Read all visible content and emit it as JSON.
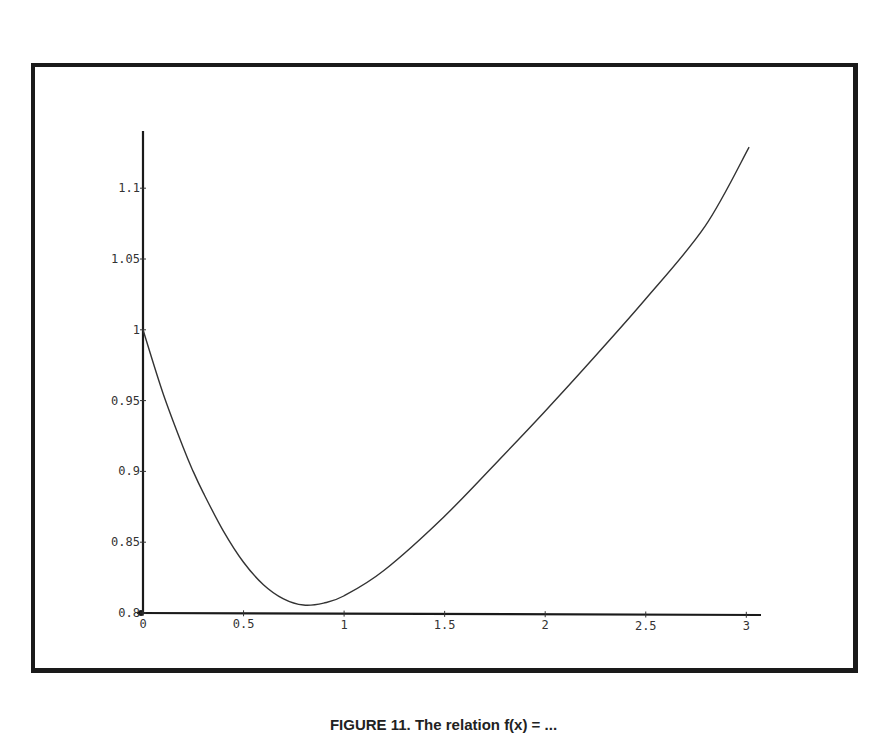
{
  "caption": "FIGURE 11. The relation f(x) = ...",
  "chart_data": {
    "type": "line",
    "title": "",
    "xlabel": "",
    "ylabel": "",
    "xlim": [
      0,
      3.08
    ],
    "ylim": [
      0.8,
      1.135
    ],
    "grid": false,
    "legend": null,
    "x_ticks": [
      0,
      0.5,
      1,
      1.5,
      2,
      2.5,
      3
    ],
    "x_tick_labels": [
      "0",
      "0.5",
      "1",
      "1.5",
      "2",
      "2.5",
      "3"
    ],
    "y_ticks": [
      0.8,
      0.85,
      0.9,
      0.95,
      1,
      1.05,
      1.1
    ],
    "y_tick_labels": [
      "0.8",
      "0.85",
      "0.9",
      "0.95",
      "1",
      "1.05",
      "1.1"
    ],
    "series": [
      {
        "name": "f(x)",
        "color": "#333333",
        "x": [
          0,
          0.1,
          0.2,
          0.25,
          0.3,
          0.4,
          0.5,
          0.6,
          0.7,
          0.8,
          0.9,
          1.0,
          1.2,
          1.5,
          1.8,
          2.0,
          2.2,
          2.5,
          2.8,
          3.02
        ],
        "y": [
          1.0,
          0.955,
          0.917,
          0.9,
          0.885,
          0.858,
          0.836,
          0.82,
          0.81,
          0.8056,
          0.807,
          0.812,
          0.83,
          0.868,
          0.912,
          0.942,
          0.973,
          1.021,
          1.073,
          1.129
        ]
      }
    ]
  }
}
